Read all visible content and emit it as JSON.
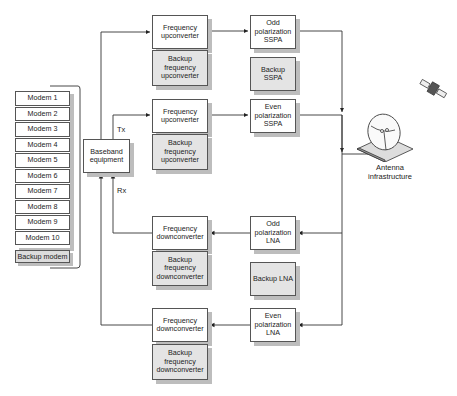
{
  "diagram": {
    "modems": [
      "Modem 1",
      "Modem 2",
      "Modem 3",
      "Modem 4",
      "Modem 5",
      "Modem 6",
      "Modem 7",
      "Modem 8",
      "Modem 9",
      "Modem 10"
    ],
    "backup_modem": "Backup modem",
    "baseband": "Baseband equipment",
    "tx_label": "Tx",
    "rx_label": "Rx",
    "uplink": {
      "upconverter_1": "Frequency upconverter",
      "backup_upconverter_1": "Backup frequency upconverter",
      "upconverter_2": "Frequency upconverter",
      "backup_upconverter_2": "Backup frequency upconverter",
      "odd_sspa": "Odd polarization SSPA",
      "backup_sspa": "Backup SSPA",
      "even_sspa": "Even polarization SSPA"
    },
    "downlink": {
      "downconverter_1": "Frequency downconverter",
      "backup_downconverter_1": "Backup frequency downconverter",
      "downconverter_2": "Frequency downconverter",
      "backup_downconverter_2": "Backup frequency downconverter",
      "odd_lna": "Odd polarization LNA",
      "backup_lna": "Backup LNA",
      "even_lna": "Even polarization LNA"
    },
    "antenna": "Antenna infrastructure",
    "icons": {
      "antenna": "satellite-dish-icon",
      "satellite": "satellite-icon"
    }
  }
}
